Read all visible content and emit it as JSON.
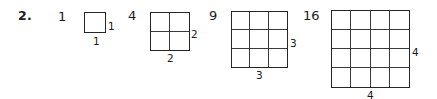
{
  "exercise": {
    "number": "2."
  },
  "figures": [
    {
      "value": "1",
      "size": 1,
      "side_label": "1",
      "bottom_label": "1",
      "value_x": 58,
      "value_y": 10,
      "grid_x": 84,
      "grid_y": 12,
      "grid_w": 22,
      "grid_h": 21,
      "side_x": 108,
      "side_y": 21,
      "bottom_x": 93,
      "bottom_y": 36
    },
    {
      "value": "4",
      "size": 2,
      "side_label": "2",
      "bottom_label": "2",
      "value_x": 128,
      "value_y": 9,
      "grid_x": 150,
      "grid_y": 12,
      "grid_w": 40,
      "grid_h": 39,
      "side_x": 191,
      "side_y": 29,
      "bottom_x": 167,
      "bottom_y": 53
    },
    {
      "value": "9",
      "size": 3,
      "side_label": "3",
      "bottom_label": "3",
      "value_x": 209,
      "value_y": 9,
      "grid_x": 231,
      "grid_y": 11,
      "grid_w": 57,
      "grid_h": 57,
      "side_x": 290,
      "side_y": 38,
      "bottom_x": 256,
      "bottom_y": 70
    },
    {
      "value": "16",
      "size": 4,
      "side_label": "4",
      "bottom_label": "4",
      "value_x": 303,
      "value_y": 9,
      "grid_x": 331,
      "grid_y": 10,
      "grid_w": 79,
      "grid_h": 78,
      "side_x": 412,
      "side_y": 47,
      "bottom_x": 367,
      "bottom_y": 90
    }
  ],
  "colors": {
    "ink": "#1a1a1a",
    "outer_border": "#262626",
    "inner_line": "#3a3a3a",
    "background": "#ffffff"
  }
}
